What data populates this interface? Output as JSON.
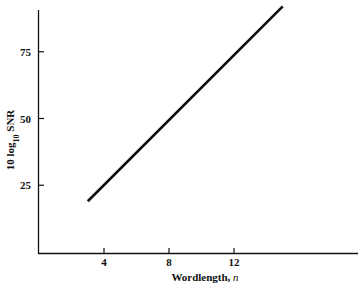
{
  "chart_data": {
    "type": "line",
    "title": "",
    "xlabel": "Wordlength, n",
    "ylabel": "10 log10 SNR",
    "ylabel_parts": {
      "prefix": "10 log",
      "sub": "10",
      "suffix": " SNR"
    },
    "xlabel_parts": {
      "main": "Wordlength, ",
      "italic": "n"
    },
    "x_ticks": [
      4,
      8,
      12
    ],
    "y_ticks": [
      25,
      50,
      75
    ],
    "xlim": [
      0,
      20
    ],
    "ylim": [
      0,
      95
    ],
    "grid": false,
    "legend": null,
    "series": [
      {
        "name": "SNR vs wordlength",
        "x": [
          3,
          15
        ],
        "y": [
          19,
          92
        ]
      }
    ]
  }
}
